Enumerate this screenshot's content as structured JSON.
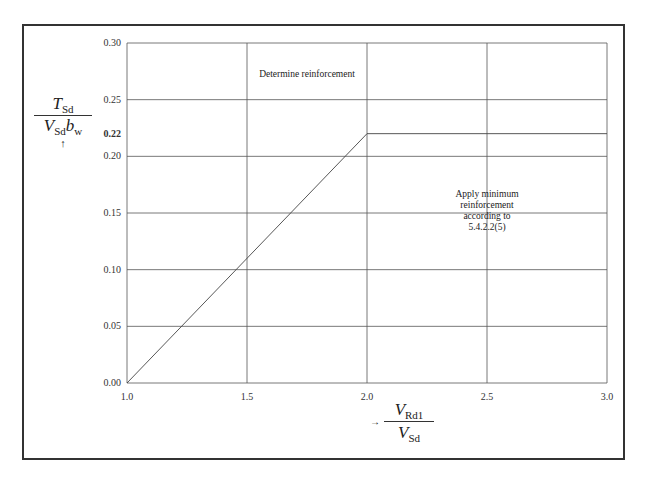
{
  "chart_data": {
    "type": "line",
    "title": "",
    "xlabel": "V_Rd1 / V_Sd",
    "ylabel": "T_Sd / (V_Sd b_w)",
    "x_ticks": [
      "1.0",
      "1.5",
      "2.0",
      "2.5",
      "3.0"
    ],
    "y_ticks": [
      "0.00",
      "0.05",
      "0.10",
      "0.15",
      "0.20",
      "0.25",
      "0.30"
    ],
    "highlight_y_tick": "0.22",
    "xlim": [
      1.0,
      3.0
    ],
    "ylim": [
      0.0,
      0.3
    ],
    "grid": true,
    "series": [
      {
        "name": "limit",
        "x": [
          1.0,
          2.0,
          3.0
        ],
        "y": [
          0.0,
          0.22,
          0.22
        ]
      }
    ],
    "annotations": [
      {
        "text": "Determine reinforcement",
        "x": 1.75,
        "y": 0.27
      },
      {
        "text": [
          "Apply minimum",
          "reinforcement",
          "according to",
          "5.4.2.2(5)"
        ],
        "x": 2.5,
        "y": 0.15
      }
    ]
  },
  "labels": {
    "y_num": "T",
    "y_num_sub": "Sd",
    "y_den": "V",
    "y_den_sub": "Sd",
    "y_den_b": "b",
    "y_den_b_sub": "w",
    "y_arrow": "↑",
    "x_arrow": "→",
    "x_num": "V",
    "x_num_sub": "Rd1",
    "x_den": "V",
    "x_den_sub": "Sd"
  }
}
